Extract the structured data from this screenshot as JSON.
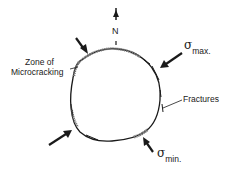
{
  "diagram": {
    "north_label": "N",
    "labels": {
      "zone_line1": "Zone of",
      "zone_line2": "Microcracking",
      "fractures": "Fractures",
      "sigma_symbol": "σ",
      "sigma_max_sub": "max.",
      "sigma_min_sub": "min."
    },
    "colors": {
      "ink": "#1a1a1a",
      "hatch": "#777777",
      "background": "#ffffff"
    }
  }
}
